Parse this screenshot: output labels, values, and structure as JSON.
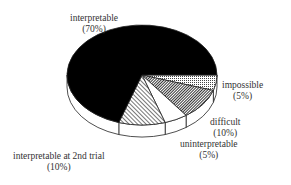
{
  "chart_data": {
    "type": "pie",
    "style": "3d-exploded-none",
    "title": "",
    "categories": [
      "interpretable",
      "impossible",
      "difficult",
      "uninterpretable",
      "interpretable at 2nd trial"
    ],
    "values": [
      70,
      5,
      10,
      5,
      10
    ],
    "unit": "%",
    "fills": {
      "interpretable": "solid-black",
      "impossible": "grid-pattern",
      "difficult": "dense-diagonal-hatch",
      "uninterpretable": "white",
      "interpretable at 2nd trial": "light-diagonal-hatch"
    },
    "labels": [
      {
        "name": "interpretable",
        "pct": "(70%)"
      },
      {
        "name": "impossible",
        "pct": "(5%)"
      },
      {
        "name": "difficult",
        "pct": "(10%)"
      },
      {
        "name": "uninterpretable",
        "pct": "(5%)"
      },
      {
        "name": "interpretable at 2nd trial",
        "pct": "(10%)"
      }
    ]
  }
}
